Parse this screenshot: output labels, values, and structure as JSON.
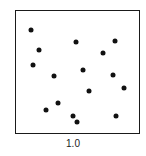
{
  "chart_data": {
    "type": "scatter",
    "title": "",
    "xlabel": "1.0",
    "ylabel": "",
    "xlim": [
      0,
      1
    ],
    "ylim": [
      0,
      1
    ],
    "grid": false,
    "legend": null,
    "points_px": [
      [
        31,
        30
      ],
      [
        39,
        50
      ],
      [
        33,
        65
      ],
      [
        76,
        42
      ],
      [
        115,
        41
      ],
      [
        103,
        53
      ],
      [
        54,
        76
      ],
      [
        83,
        70
      ],
      [
        113,
        75
      ],
      [
        124,
        88
      ],
      [
        89,
        91
      ],
      [
        58,
        103
      ],
      [
        46,
        110
      ],
      [
        73,
        116
      ],
      [
        77,
        122
      ],
      [
        116,
        116
      ]
    ],
    "points": [
      {
        "x": 0.13,
        "y": 0.84
      },
      {
        "x": 0.19,
        "y": 0.68
      },
      {
        "x": 0.14,
        "y": 0.56
      },
      {
        "x": 0.49,
        "y": 0.74
      },
      {
        "x": 0.8,
        "y": 0.75
      },
      {
        "x": 0.7,
        "y": 0.65
      },
      {
        "x": 0.31,
        "y": 0.47
      },
      {
        "x": 0.54,
        "y": 0.52
      },
      {
        "x": 0.78,
        "y": 0.48
      },
      {
        "x": 0.87,
        "y": 0.37
      },
      {
        "x": 0.59,
        "y": 0.35
      },
      {
        "x": 0.34,
        "y": 0.25
      },
      {
        "x": 0.25,
        "y": 0.19
      },
      {
        "x": 0.46,
        "y": 0.15
      },
      {
        "x": 0.49,
        "y": 0.1
      },
      {
        "x": 0.81,
        "y": 0.15
      }
    ]
  },
  "scale_label": "1.0"
}
